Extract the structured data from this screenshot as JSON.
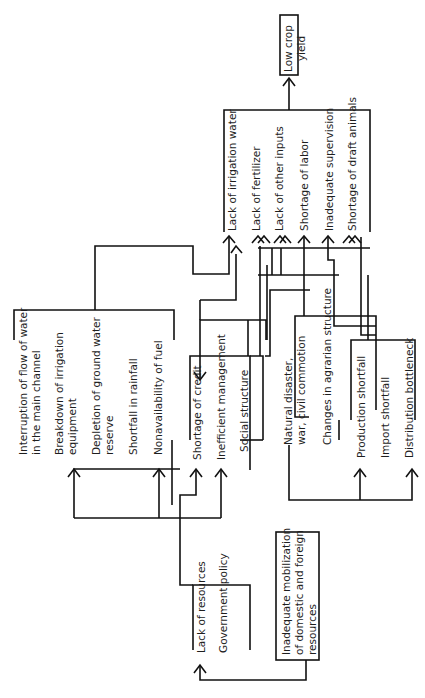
{
  "diagram": {
    "outcome": {
      "label": "Low crop\nyield"
    },
    "direct_causes": [
      {
        "label": "Lack of irrigation water"
      },
      {
        "label": "Lack of fertilizer"
      },
      {
        "label": "Lack of other inputs"
      },
      {
        "label": "Shortage of labor"
      },
      {
        "label": "Inadequate supervision"
      },
      {
        "label": "Shortage of draft animals"
      }
    ],
    "water_causes": [
      {
        "label": "Interruption of flow of water\nin the main channel"
      },
      {
        "label": "Breakdown of irrigation\nequipment"
      },
      {
        "label": "Depletion of ground water\nreserve"
      },
      {
        "label": "Shortfall in rainfall"
      },
      {
        "label": "Nonavailability of fuel"
      }
    ],
    "management_causes": [
      {
        "label": "Shortage of credit"
      },
      {
        "label": "Inefficient management"
      },
      {
        "label": "Social structure"
      }
    ],
    "social_causes": [
      {
        "label": "Natural disaster,\nwar, civil commotion"
      },
      {
        "label": "Changes in agrarian structure"
      }
    ],
    "supply_causes": [
      {
        "label": "Production shortfall"
      },
      {
        "label": "Import shortfall"
      },
      {
        "label": "Distribution bottleneck"
      }
    ],
    "resource_causes": [
      {
        "label": "Lack of resources"
      },
      {
        "label": "Government policy"
      }
    ],
    "root_cause": {
      "label": "Inadequate mobilization\nof domestic and foreign\nresources"
    }
  },
  "colors": {
    "line": "#111111",
    "background": "#ffffff"
  }
}
